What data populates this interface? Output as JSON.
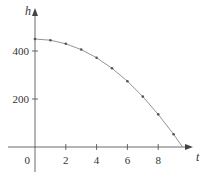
{
  "chart_data": {
    "type": "line",
    "title": "",
    "xlabel": "t",
    "ylabel": "h",
    "x_ticks": [
      0,
      2,
      4,
      6,
      8
    ],
    "y_ticks": [
      200,
      400
    ],
    "origin_label": "0",
    "xlim": [
      -2,
      10.2
    ],
    "ylim": [
      -70,
      550
    ],
    "grid": false,
    "legend": null,
    "series": [
      {
        "name": "h(t)",
        "x": [
          0,
          1,
          2,
          3,
          4,
          5,
          6,
          7,
          8,
          9,
          9.58
        ],
        "values": [
          450,
          445,
          430,
          406,
          372,
          328,
          274,
          210,
          136,
          53,
          0
        ]
      }
    ],
    "markers_at": [
      0,
      1,
      2,
      3,
      4,
      5,
      6,
      7,
      8,
      9
    ],
    "colors": {
      "axis": "#444444",
      "curve": "#888888",
      "marker": "#555555"
    }
  }
}
